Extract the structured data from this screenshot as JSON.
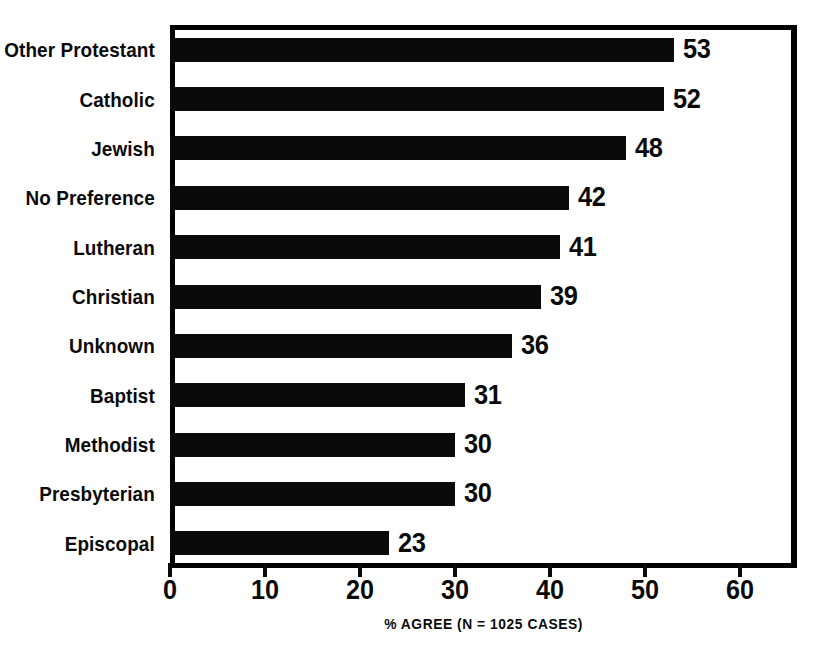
{
  "chart_data": {
    "type": "bar",
    "orientation": "horizontal",
    "title": "",
    "xlabel": "% AGREE (N = 1025 CASES)",
    "ylabel": "",
    "categories": [
      "Other Protestant",
      "Catholic",
      "Jewish",
      "No Preference",
      "Lutheran",
      "Christian",
      "Unknown",
      "Baptist",
      "Methodist",
      "Presbyterian",
      "Episcopal"
    ],
    "values": [
      53,
      52,
      48,
      42,
      41,
      39,
      36,
      31,
      30,
      30,
      23
    ],
    "value_labels": [
      "53",
      "52",
      "48",
      "42",
      "41",
      "39",
      "36",
      "31",
      "30",
      "30",
      "23"
    ],
    "xlim": [
      0,
      66
    ],
    "xticks": [
      0,
      10,
      20,
      30,
      40,
      50,
      60
    ],
    "xtick_labels": [
      "0",
      "10",
      "20",
      "30",
      "40",
      "50",
      "60"
    ],
    "grid": false,
    "legend": false,
    "bar_color": "#0a0a0a",
    "background_color": "#ffffff",
    "frame_color": "#000000"
  },
  "axis": {
    "caption": "% AGREE (N = 1025 CASES)"
  },
  "title_sliver": {
    "text": ""
  }
}
